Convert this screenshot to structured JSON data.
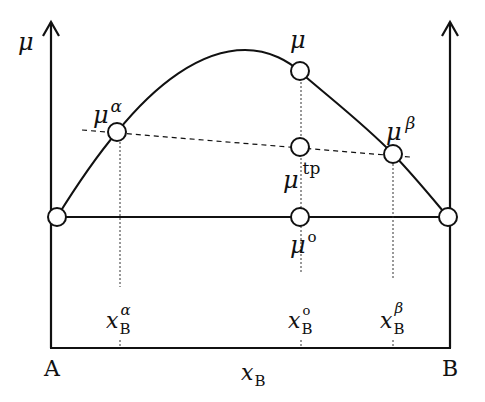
{
  "diagram": {
    "title": "",
    "y_axis_label": "μ",
    "x_axis_label": {
      "base": "x",
      "sub": "B"
    },
    "left_end_label": "A",
    "right_end_label": "B",
    "points": {
      "mu": {
        "base": "μ",
        "sup": ""
      },
      "mu_alpha": {
        "base": "μ",
        "sup": "α"
      },
      "mu_beta": {
        "base": "μ",
        "sup": "β"
      },
      "mu_tp": {
        "base": "μ",
        "sup": "tp"
      },
      "mu_o": {
        "base": "μ",
        "sup": "o"
      }
    },
    "composition_ticks": [
      {
        "base": "x",
        "sub": "B",
        "sup": "α"
      },
      {
        "base": "x",
        "sub": "B",
        "sup": "o"
      },
      {
        "base": "x",
        "sub": "B",
        "sup": "β"
      }
    ]
  }
}
